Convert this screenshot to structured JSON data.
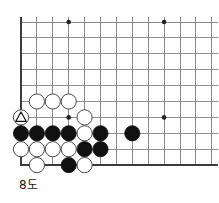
{
  "figure": {
    "caption": "8도",
    "kind": "go-board-diagram",
    "board_region": "bottom-left corner",
    "colors": {
      "background": "#ffffff",
      "grid_line": "#8a8a8a",
      "board_edge": "#3c3c3c",
      "black_stone_fill": "#111111",
      "white_stone_fill": "#ffffff",
      "stone_outline": "#4a4a4a",
      "star_point": "#222222",
      "caption_text": "#1a1a1a",
      "marker": "#111111"
    },
    "geometry": {
      "origin_x": 21,
      "origin_y": 22,
      "spacing": 15.9,
      "columns": 13,
      "rows": 10,
      "stone_radius": 7.6
    },
    "star_points": [
      {
        "col": 3,
        "row": 0
      },
      {
        "col": 9,
        "row": 0
      },
      {
        "col": 3,
        "row": 6
      },
      {
        "col": 9,
        "row": 6
      }
    ],
    "stones": [
      {
        "id": "w-c1r5",
        "color": "white",
        "col": 1,
        "row": 5,
        "marker": "none"
      },
      {
        "id": "w-c2r5",
        "color": "white",
        "col": 2,
        "row": 5,
        "marker": "none"
      },
      {
        "id": "w-c3r5",
        "color": "white",
        "col": 3,
        "row": 5,
        "marker": "none"
      },
      {
        "id": "w-c0r6",
        "color": "white",
        "col": 0,
        "row": 6,
        "marker": "triangle"
      },
      {
        "id": "w-c4r6",
        "color": "white",
        "col": 4,
        "row": 6,
        "marker": "none"
      },
      {
        "id": "b-c0r7",
        "color": "black",
        "col": 0,
        "row": 7,
        "marker": "none"
      },
      {
        "id": "b-c1r7",
        "color": "black",
        "col": 1,
        "row": 7,
        "marker": "none"
      },
      {
        "id": "b-c2r7",
        "color": "black",
        "col": 2,
        "row": 7,
        "marker": "none"
      },
      {
        "id": "b-c3r7",
        "color": "black",
        "col": 3,
        "row": 7,
        "marker": "none"
      },
      {
        "id": "w-c4r7",
        "color": "white",
        "col": 4,
        "row": 7,
        "marker": "none"
      },
      {
        "id": "b-c5r7",
        "color": "black",
        "col": 5,
        "row": 7,
        "marker": "none"
      },
      {
        "id": "b-c7r7",
        "color": "black",
        "col": 7,
        "row": 7,
        "marker": "none"
      },
      {
        "id": "w-c0r8",
        "color": "white",
        "col": 0,
        "row": 8,
        "marker": "none"
      },
      {
        "id": "w-c1r8",
        "color": "white",
        "col": 1,
        "row": 8,
        "marker": "none"
      },
      {
        "id": "w-c2r8",
        "color": "white",
        "col": 2,
        "row": 8,
        "marker": "none"
      },
      {
        "id": "w-c3r8",
        "color": "white",
        "col": 3,
        "row": 8,
        "marker": "none"
      },
      {
        "id": "b-c4r8",
        "color": "black",
        "col": 4,
        "row": 8,
        "marker": "none"
      },
      {
        "id": "b-c5r8",
        "color": "black",
        "col": 5,
        "row": 8,
        "marker": "none"
      },
      {
        "id": "w-c1r9",
        "color": "white",
        "col": 1,
        "row": 9,
        "marker": "none"
      },
      {
        "id": "b-c3r9",
        "color": "black",
        "col": 3,
        "row": 9,
        "marker": "none"
      },
      {
        "id": "w-c4r9",
        "color": "white",
        "col": 4,
        "row": 9,
        "marker": "none"
      }
    ]
  }
}
